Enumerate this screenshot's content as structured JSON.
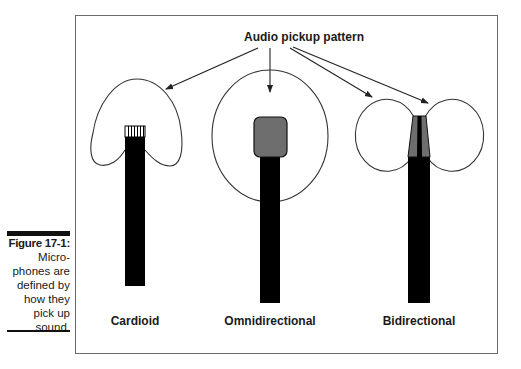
{
  "caption": {
    "figure_number": "Figure 17-1:",
    "text": "Micro-\nphones are\ndefined by\nhow they\npick up\nsound."
  },
  "diagram": {
    "title": "Audio pickup pattern",
    "microphones": [
      {
        "type": "cardioid",
        "label": "Cardioid",
        "pattern": "heart-shaped",
        "head": "striped-grille"
      },
      {
        "type": "omnidirectional",
        "label": "Omnidirectional",
        "pattern": "circle",
        "head": "rounded-gray"
      },
      {
        "type": "bidirectional",
        "label": "Bidirectional",
        "pattern": "figure-eight",
        "head": "tapered-gray"
      }
    ],
    "colors": {
      "mic_body": "#000000",
      "mic_head_gray": "#6e6e6e",
      "outline": "#333333",
      "frame": "#6b6b6b"
    }
  }
}
